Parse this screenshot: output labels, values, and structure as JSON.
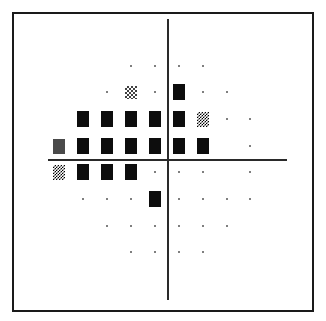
{
  "chart_data": {
    "type": "grayscale_visual_field_plot",
    "title": "",
    "axes": {
      "vertical_meridian": true,
      "horizontal_meridian": true
    },
    "grid": {
      "columns_x": [
        59,
        83,
        107,
        131,
        155,
        179,
        203,
        227,
        250
      ],
      "rows_y": [
        66,
        92,
        119,
        146,
        172,
        199,
        226,
        252
      ]
    },
    "legend_symbols": {
      "dot": "normal",
      "checker-light": "mild depression",
      "checker-dense": "moderate depression",
      "grey": "severe depression",
      "black": "absolute defect"
    },
    "points": [
      {
        "r": 0,
        "c": 3,
        "s": "dot"
      },
      {
        "r": 0,
        "c": 4,
        "s": "dot"
      },
      {
        "r": 0,
        "c": 5,
        "s": "dot"
      },
      {
        "r": 0,
        "c": 6,
        "s": "dot"
      },
      {
        "r": 1,
        "c": 2,
        "s": "dot"
      },
      {
        "r": 1,
        "c": 3,
        "s": "checker-light"
      },
      {
        "r": 1,
        "c": 4,
        "s": "dot"
      },
      {
        "r": 1,
        "c": 5,
        "s": "black"
      },
      {
        "r": 1,
        "c": 6,
        "s": "dot"
      },
      {
        "r": 1,
        "c": 7,
        "s": "dot"
      },
      {
        "r": 2,
        "c": 1,
        "s": "black"
      },
      {
        "r": 2,
        "c": 2,
        "s": "black"
      },
      {
        "r": 2,
        "c": 3,
        "s": "black"
      },
      {
        "r": 2,
        "c": 4,
        "s": "black"
      },
      {
        "r": 2,
        "c": 5,
        "s": "black"
      },
      {
        "r": 2,
        "c": 6,
        "s": "checker-dense"
      },
      {
        "r": 2,
        "c": 7,
        "s": "dot"
      },
      {
        "r": 2,
        "c": 8,
        "s": "dot"
      },
      {
        "r": 3,
        "c": 0,
        "s": "grey"
      },
      {
        "r": 3,
        "c": 1,
        "s": "black"
      },
      {
        "r": 3,
        "c": 2,
        "s": "black"
      },
      {
        "r": 3,
        "c": 3,
        "s": "black"
      },
      {
        "r": 3,
        "c": 4,
        "s": "black"
      },
      {
        "r": 3,
        "c": 5,
        "s": "black"
      },
      {
        "r": 3,
        "c": 6,
        "s": "black"
      },
      {
        "r": 3,
        "c": 8,
        "s": "dot"
      },
      {
        "r": 4,
        "c": 0,
        "s": "checker-dense"
      },
      {
        "r": 4,
        "c": 1,
        "s": "black"
      },
      {
        "r": 4,
        "c": 2,
        "s": "black"
      },
      {
        "r": 4,
        "c": 3,
        "s": "black"
      },
      {
        "r": 4,
        "c": 4,
        "s": "dot"
      },
      {
        "r": 4,
        "c": 5,
        "s": "dot"
      },
      {
        "r": 4,
        "c": 6,
        "s": "dot"
      },
      {
        "r": 4,
        "c": 8,
        "s": "dot"
      },
      {
        "r": 5,
        "c": 1,
        "s": "dot"
      },
      {
        "r": 5,
        "c": 2,
        "s": "dot"
      },
      {
        "r": 5,
        "c": 3,
        "s": "dot"
      },
      {
        "r": 5,
        "c": 4,
        "s": "black"
      },
      {
        "r": 5,
        "c": 5,
        "s": "dot"
      },
      {
        "r": 5,
        "c": 6,
        "s": "dot"
      },
      {
        "r": 5,
        "c": 7,
        "s": "dot"
      },
      {
        "r": 5,
        "c": 8,
        "s": "dot"
      },
      {
        "r": 6,
        "c": 2,
        "s": "dot"
      },
      {
        "r": 6,
        "c": 3,
        "s": "dot"
      },
      {
        "r": 6,
        "c": 4,
        "s": "dot"
      },
      {
        "r": 6,
        "c": 5,
        "s": "dot"
      },
      {
        "r": 6,
        "c": 6,
        "s": "dot"
      },
      {
        "r": 6,
        "c": 7,
        "s": "dot"
      },
      {
        "r": 7,
        "c": 3,
        "s": "dot"
      },
      {
        "r": 7,
        "c": 4,
        "s": "dot"
      },
      {
        "r": 7,
        "c": 5,
        "s": "dot"
      },
      {
        "r": 7,
        "c": 6,
        "s": "dot"
      }
    ]
  }
}
